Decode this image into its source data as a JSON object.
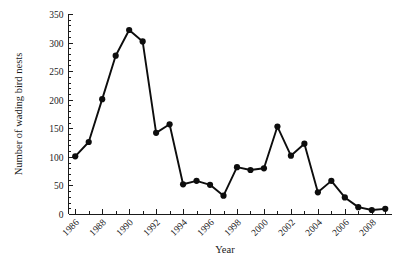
{
  "chart_data": {
    "type": "line",
    "title": "",
    "xlabel": "Year",
    "ylabel": "Number of wading bird nests",
    "xlim": [
      1985.5,
      2009.5
    ],
    "ylim": [
      0,
      350
    ],
    "grid": false,
    "legend": null,
    "y_ticks": [
      0,
      50,
      100,
      150,
      200,
      250,
      300,
      350
    ],
    "y_tick_labels": [
      "0",
      "50",
      "100",
      "150",
      "200",
      "250",
      "300",
      "350"
    ],
    "x_ticks": [
      1986,
      1988,
      1990,
      1992,
      1994,
      1996,
      1998,
      2000,
      2002,
      2004,
      2006,
      2008
    ],
    "x_tick_labels": [
      "1986",
      "1988",
      "1990",
      "1992",
      "1994",
      "1996",
      "1998",
      "2000",
      "2002",
      "2004",
      "2006",
      "2008"
    ],
    "x_minor_ticks": [
      1987,
      1989,
      1991,
      1993,
      1995,
      1997,
      1999,
      2001,
      2003,
      2005,
      2007,
      2009
    ],
    "marker": "filled-circle",
    "series_color": "#0d0d0d",
    "x": [
      1986,
      1987,
      1988,
      1989,
      1990,
      1991,
      1992,
      1993,
      1994,
      1995,
      1996,
      1997,
      1998,
      1999,
      2000,
      2001,
      2002,
      2003,
      2004,
      2005,
      2006,
      2007,
      2008,
      2009
    ],
    "values": [
      101,
      126,
      201,
      277,
      322,
      302,
      142,
      157,
      52,
      58,
      51,
      32,
      82,
      77,
      80,
      153,
      102,
      123,
      38,
      58,
      29,
      12,
      7,
      9
    ]
  },
  "axis": {
    "y_title": "Number of wading bird nests",
    "x_title": "Year"
  }
}
